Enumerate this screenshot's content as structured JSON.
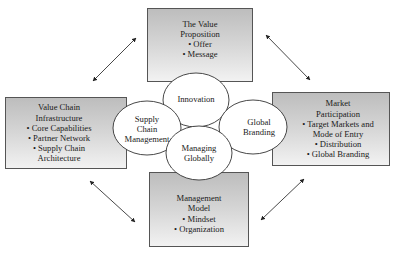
{
  "diagram": {
    "boxes": {
      "top": {
        "title_lines": [
          "The Value",
          "Proposition"
        ],
        "bullets": [
          "• Offer",
          "• Message"
        ]
      },
      "left": {
        "title_lines": [
          "Value Chain",
          "Infrastructure"
        ],
        "bullets": [
          "• Core Capabilities",
          "• Partner Network",
          "• Supply Chain",
          "Architecture"
        ]
      },
      "right": {
        "title_lines": [
          "Market",
          "Participation"
        ],
        "bullets": [
          "• Target Markets and",
          "Mode of Entry",
          "• Distribution",
          "• Global Branding"
        ]
      },
      "bottom": {
        "title_lines": [
          "Management",
          "Model"
        ],
        "bullets": [
          "• Mindset",
          "• Organization"
        ]
      }
    },
    "ellipses": {
      "innovation": {
        "lines": [
          "Innovation"
        ]
      },
      "supply_chain": {
        "lines": [
          "Supply",
          "Chain",
          "Management"
        ]
      },
      "global_branding": {
        "lines": [
          "Global",
          "Branding"
        ]
      },
      "managing_globally": {
        "lines": [
          "Managing",
          "Globally"
        ]
      }
    },
    "connectors": [
      {
        "from": "left-box",
        "to": "top-box",
        "type": "double-arrow"
      },
      {
        "from": "top-box",
        "to": "right-box",
        "type": "double-arrow"
      },
      {
        "from": "left-box",
        "to": "bottom-box",
        "type": "double-arrow"
      },
      {
        "from": "bottom-box",
        "to": "right-box",
        "type": "double-arrow"
      }
    ],
    "colors": {
      "box_gradient_top": "#bdbdbd",
      "box_gradient_bottom": "#f2f2f2",
      "border": "#555555",
      "ellipse_fill": "#ffffff"
    }
  }
}
